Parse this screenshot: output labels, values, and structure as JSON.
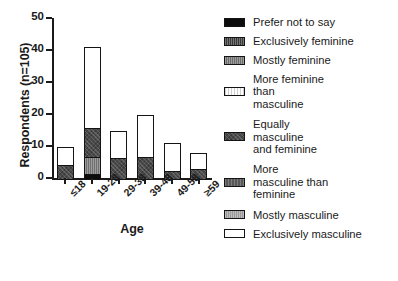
{
  "chart_data": {
    "type": "bar",
    "subtype": "stacked",
    "title": "",
    "xlabel": "Age",
    "ylabel": "Respondents (n=105)",
    "categories": [
      "≤18",
      "19-28",
      "29-38",
      "39-48",
      "49-58",
      "≥59"
    ],
    "ylim": [
      0,
      50
    ],
    "yticks": [
      0,
      10,
      20,
      30,
      40,
      50
    ],
    "grid": false,
    "legend_position": "right",
    "series": [
      {
        "name": "Prefer not to say",
        "key": "prefer-not",
        "values": [
          0,
          1.5,
          0,
          0,
          0,
          0
        ]
      },
      {
        "name": "Exclusively feminine",
        "key": "excl-fem",
        "values": [
          0,
          0,
          0,
          0,
          0,
          0
        ]
      },
      {
        "name": "Mostly feminine",
        "key": "mostly-fem",
        "values": [
          0,
          5.5,
          0,
          0,
          0,
          0
        ]
      },
      {
        "name": "More feminine\nthan\nmasculine",
        "key": "more-fem",
        "values": [
          0,
          0,
          0,
          0,
          0,
          0
        ]
      },
      {
        "name": "Equally\nmasculine\nand feminine",
        "key": "equally",
        "values": [
          4.5,
          9,
          6.5,
          7,
          2.5,
          3
        ]
      },
      {
        "name": "More\nmasculine than\nfeminine",
        "key": "more-masc",
        "values": [
          0,
          0,
          0,
          0,
          0,
          0
        ]
      },
      {
        "name": "Mostly masculine",
        "key": "mostly-masc",
        "values": [
          0,
          0,
          0,
          0,
          0,
          0
        ]
      },
      {
        "name": "Exclusively masculine",
        "key": "excl-masc",
        "values": [
          5.5,
          25,
          8.5,
          13,
          8.5,
          5
        ]
      }
    ],
    "totals": [
      10,
      41,
      15,
      20,
      11,
      8
    ]
  },
  "axis": {
    "y_tick_labels": [
      "0",
      "10",
      "20",
      "30",
      "40",
      "50"
    ],
    "x_tick_labels": [
      "≤18",
      "19-28",
      "29-38",
      "39-48",
      "49-58",
      "≥59"
    ],
    "y_title": "Respondents (n=105)",
    "x_title": "Age"
  },
  "legend": {
    "items": [
      {
        "label": "Prefer not to say",
        "key": "prefer-not"
      },
      {
        "label": "Exclusively feminine",
        "key": "excl-fem"
      },
      {
        "label": "Mostly feminine",
        "key": "mostly-fem"
      },
      {
        "label": "More feminine\nthan\nmasculine",
        "key": "more-fem"
      },
      {
        "label": "Equally\nmasculine\nand feminine",
        "key": "equally"
      },
      {
        "label": "More\nmasculine than\nfeminine",
        "key": "more-masc"
      },
      {
        "label": "Mostly masculine",
        "key": "mostly-masc"
      },
      {
        "label": "Exclusively masculine",
        "key": "excl-masc"
      }
    ]
  },
  "colors": {
    "axis": "#1a1a1a",
    "text": "#1a1a1a",
    "background": "#ffffff"
  }
}
